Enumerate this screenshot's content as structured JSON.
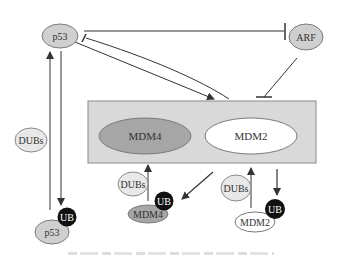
{
  "diagram": {
    "colors": {
      "node_fill": "#cfcfcf",
      "node_stroke": "#7a7a7a",
      "complex_fill": "#d9d9d9",
      "complex_stroke": "#8a8a8a",
      "mdm4_fill": "#a6a6a6",
      "mdm2_fill": "#ffffff",
      "ub_fill": "#111111",
      "line": "#333333",
      "dubs_fill": "#e8e8e8"
    },
    "nodes": {
      "p53_top": "p53",
      "arf": "ARF",
      "dubs_left": "DUBs",
      "p53_ub": "p53",
      "ub_p53": "UB",
      "complex_mdm4": "MDM4",
      "complex_mdm2": "MDM2",
      "dubs_mdm4": "DUBs",
      "mdm4_ub": "MDM4",
      "ub_mdm4": "UB",
      "dubs_mdm2": "DUBs",
      "mdm2_ub": "MDM2",
      "ub_mdm2": "UB"
    },
    "edges": [
      {
        "from": "p53",
        "to": "ARF",
        "type": "inhibition"
      },
      {
        "from": "MDM4/MDM2 complex",
        "to": "p53",
        "type": "inhibition"
      },
      {
        "from": "p53",
        "to": "MDM4/MDM2 complex",
        "type": "activation"
      },
      {
        "from": "ARF",
        "to": "MDM4/MDM2 complex",
        "type": "inhibition"
      },
      {
        "from": "p53",
        "to": "p53-UB",
        "type": "ubiquitination"
      },
      {
        "from": "p53-UB",
        "to": "p53",
        "type": "deubiquitination (DUBs)"
      },
      {
        "from": "MDM2",
        "to": "MDM4-UB",
        "type": "ubiquitination"
      },
      {
        "from": "MDM4-UB",
        "to": "MDM4",
        "type": "deubiquitination (DUBs)"
      },
      {
        "from": "MDM2",
        "to": "MDM2-UB",
        "type": "auto-ubiquitination"
      },
      {
        "from": "MDM2-UB",
        "to": "MDM2",
        "type": "deubiquitination (DUBs)"
      }
    ]
  }
}
